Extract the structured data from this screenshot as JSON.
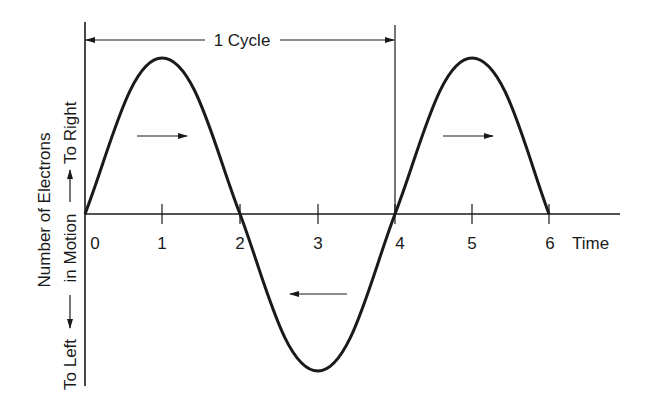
{
  "diagram": {
    "title_bracket_label": "1 Cycle",
    "x_axis_label": "Time",
    "x_ticks": [
      "0",
      "1",
      "2",
      "3",
      "4",
      "5",
      "6"
    ],
    "y_axis_label_line1": "Number of Electrons",
    "y_axis_label_line2_left": "To Left",
    "y_axis_label_line2_mid": "in Motion",
    "y_axis_label_line2_right": "To Right",
    "direction_arrows": [
      {
        "position": "first positive half-cycle",
        "direction": "right"
      },
      {
        "position": "negative half-cycle",
        "direction": "left"
      },
      {
        "position": "second positive half-cycle",
        "direction": "right"
      }
    ],
    "curve": "sine wave, period 4 time units, spanning t=0 to t=6",
    "colors": {
      "ink": "#1a1a1a",
      "background": "#ffffff"
    }
  }
}
